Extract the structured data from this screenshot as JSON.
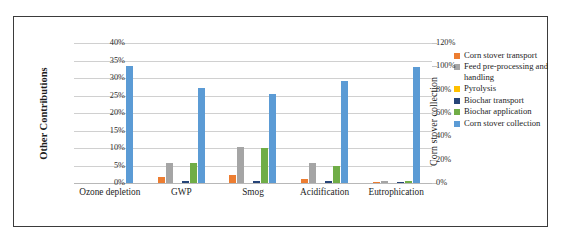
{
  "chart_data": {
    "type": "bar",
    "title": "",
    "xlabel": "",
    "ylabel": "Other Contributions",
    "y2label": "Corn stover collection",
    "grid": true,
    "legend_position": "right",
    "categories": [
      "Ozone depletion",
      "GWP",
      "Smog",
      "Acidification",
      "Eutrophication"
    ],
    "ylim": [
      0,
      40
    ],
    "y2lim": [
      0,
      120
    ],
    "yticks": [
      "0%",
      "5%",
      "10%",
      "15%",
      "20%",
      "25%",
      "30%",
      "35%",
      "40%"
    ],
    "ytick_values": [
      0,
      5,
      10,
      15,
      20,
      25,
      30,
      35,
      40
    ],
    "y2ticks": [
      "0%",
      "20%",
      "40%",
      "60%",
      "80%",
      "100%",
      "120%"
    ],
    "y2tick_values": [
      0,
      20,
      40,
      60,
      80,
      100,
      120
    ],
    "series": [
      {
        "name": "Corn stover transport",
        "color": "#ED7D31",
        "axis": "left",
        "values": [
          0.0,
          1.6,
          2.2,
          1.1,
          0.3
        ]
      },
      {
        "name": "Feed pre-processing and handling",
        "color": "#A5A5A5",
        "axis": "left",
        "values": [
          0.0,
          5.6,
          10.3,
          5.6,
          0.5
        ]
      },
      {
        "name": "Pyrolysis",
        "color": "#FFC000",
        "axis": "left",
        "values": [
          0.0,
          0.0,
          0.0,
          0.0,
          0.0
        ]
      },
      {
        "name": "Biochar transport",
        "color": "#264478",
        "axis": "left",
        "values": [
          0.0,
          0.7,
          0.7,
          0.5,
          0.2
        ]
      },
      {
        "name": "Biochar application",
        "color": "#70AD47",
        "axis": "left",
        "values": [
          0.0,
          5.6,
          10.0,
          5.0,
          0.5
        ]
      },
      {
        "name": "Corn stover collection",
        "color": "#5B9BD5",
        "axis": "right",
        "values": [
          100.0,
          81.0,
          76.5,
          87.0,
          99.0
        ],
        "values_left_scale": [
          33.5,
          27.1,
          25.5,
          29.1,
          33.1
        ]
      }
    ]
  },
  "axes": {
    "left_title": "Other Contributions",
    "right_title": "Corn stover collection"
  },
  "legend": {
    "items": [
      {
        "label": "Corn stover transport",
        "color": "#ED7D31"
      },
      {
        "label": "Feed pre-processing and handling",
        "color": "#A5A5A5"
      },
      {
        "label": "Pyrolysis",
        "color": "#FFC000"
      },
      {
        "label": "Biochar transport",
        "color": "#264478"
      },
      {
        "label": "Biochar application",
        "color": "#70AD47"
      },
      {
        "label": "Corn stover collection",
        "color": "#5B9BD5"
      }
    ]
  }
}
